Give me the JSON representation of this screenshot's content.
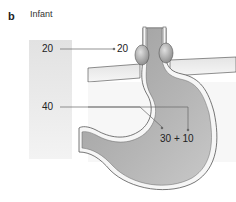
{
  "figure": {
    "panel_letter": "b",
    "title": "Infant"
  },
  "labels": {
    "les_pressure_left": "20",
    "les_pressure_right": "20",
    "gastric_reference": "40",
    "gastric_components": "30 + 10"
  },
  "colors": {
    "stomach_fill": "#a9a9a9",
    "wall": "#f4f4f4",
    "outline": "#555555",
    "diaphragm": "#dcdcdc",
    "scale_bg": "#e6e6e6"
  }
}
